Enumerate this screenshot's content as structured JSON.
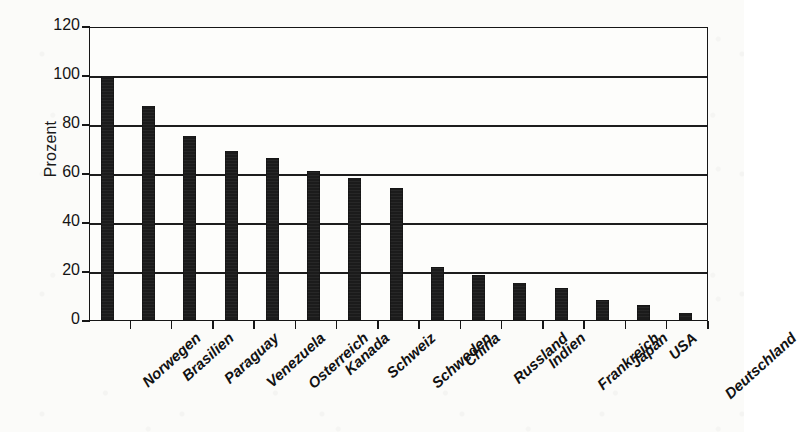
{
  "chart_data": {
    "type": "bar",
    "title": "",
    "subtitle": "",
    "xlabel": "",
    "ylabel": "Prozent",
    "ylim": [
      0,
      120
    ],
    "yticks": [
      0,
      20,
      40,
      60,
      80,
      100,
      120
    ],
    "ytick_labels": [
      "0",
      "20",
      "40",
      "60",
      "80",
      "100",
      "120"
    ],
    "grid": true,
    "grid_axis": "y",
    "legend": false,
    "legend_position": "none",
    "orientation": "vertical",
    "bar_color": "#1b1b1b",
    "categories": [
      "Norwegen",
      "Brasilien",
      "Paraguay",
      "Venezuela",
      "Osterreich",
      "Kanada",
      "Schweiz",
      "Schweden",
      "China",
      "Russland",
      "Indien",
      "Frankreich",
      "Japan",
      "USA",
      "Deutschland"
    ],
    "values": [
      99.5,
      87.5,
      75,
      69,
      66,
      61,
      58,
      54,
      21.5,
      18.5,
      15,
      13,
      8,
      6,
      3
    ],
    "units": "percent"
  },
  "axes": {
    "y_title": "Prozent"
  },
  "colors": {
    "bar": "#1b1b1b",
    "axis": "#161616",
    "grid": "#1d1d1d",
    "plot_background": "#fdfdfb",
    "page_background": "#fbfbf9"
  }
}
